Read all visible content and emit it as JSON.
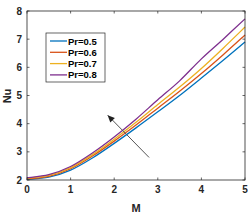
{
  "chart_data": {
    "type": "line",
    "title": "",
    "xlabel": "M",
    "ylabel": "Nu",
    "xlim": [
      0,
      5
    ],
    "ylim": [
      2,
      8
    ],
    "xticks": [
      0,
      1,
      2,
      3,
      4,
      5
    ],
    "yticks": [
      2,
      3,
      4,
      5,
      6,
      7,
      8
    ],
    "grid": false,
    "legend_position": "upper-left",
    "x": [
      0,
      0.5,
      1,
      1.5,
      2,
      2.5,
      3,
      3.5,
      4,
      4.5,
      5
    ],
    "series": [
      {
        "name": "Pr=0.5",
        "color": "#0072BD",
        "values": [
          2.02,
          2.1,
          2.35,
          2.78,
          3.3,
          3.85,
          4.42,
          5.0,
          5.62,
          6.25,
          6.9
        ]
      },
      {
        "name": "Pr=0.6",
        "color": "#D95319",
        "values": [
          2.04,
          2.13,
          2.4,
          2.85,
          3.38,
          3.95,
          4.55,
          5.15,
          5.78,
          6.45,
          7.15
        ]
      },
      {
        "name": "Pr=0.7",
        "color": "#EDB120",
        "values": [
          2.06,
          2.16,
          2.44,
          2.9,
          3.45,
          4.05,
          4.68,
          5.3,
          5.96,
          6.68,
          7.43
        ]
      },
      {
        "name": "Pr=0.8",
        "color": "#7E2F8E",
        "values": [
          2.08,
          2.19,
          2.48,
          2.96,
          3.53,
          4.16,
          4.85,
          5.52,
          6.3,
          7.0,
          7.72
        ]
      }
    ],
    "annotations": [
      {
        "type": "arrow",
        "from": [
          2.8,
          2.8
        ],
        "to": [
          1.85,
          4.3
        ],
        "meaning": "increasing Pr"
      }
    ]
  }
}
